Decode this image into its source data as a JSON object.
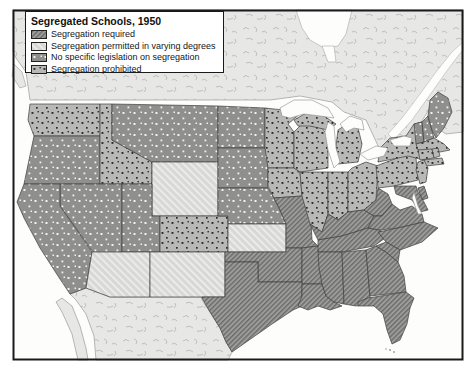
{
  "map": {
    "title": "Segregated Schools, 1950",
    "legend": [
      {
        "id": "required",
        "label": "Segregation required"
      },
      {
        "id": "permitted",
        "label": "Segregation permitted in varying degrees"
      },
      {
        "id": "no_legislation",
        "label": "No specific legislation on segregation"
      },
      {
        "id": "prohibited",
        "label": "Segregation prohibited"
      }
    ],
    "categories": {
      "required": [
        "TX",
        "OK",
        "MO",
        "AR",
        "LA",
        "MS",
        "AL",
        "TN",
        "KY",
        "WV",
        "VA",
        "NC",
        "SC",
        "GA",
        "FL",
        "MD",
        "DE"
      ],
      "permitted": [
        "AZ",
        "NM",
        "KS",
        "WY"
      ],
      "no_legislation": [
        "CA",
        "OR",
        "NV",
        "UT",
        "MT",
        "ND",
        "SD",
        "NE",
        "ME",
        "NH",
        "VT"
      ],
      "prohibited": [
        "WA",
        "ID",
        "CO",
        "MN",
        "IA",
        "WI",
        "IL",
        "IN",
        "MI",
        "OH",
        "PA",
        "NY",
        "NJ",
        "CT",
        "RI",
        "MA"
      ]
    },
    "colors": {
      "required": {
        "bg": "#9c9c9a",
        "mark": "#6c6c6a"
      },
      "permitted": {
        "bg": "#d8d8d6",
        "mark": "#f5f5f3"
      },
      "no_legislation": {
        "bg": "#8f8f8d",
        "mark": "#f2f2f0"
      },
      "prohibited": {
        "bg": "#b8b8b6",
        "mark": "#2a2a28"
      },
      "neighbor_land": "#e7e7e5",
      "terrain_mark": "#b2b2b0",
      "water": "#fdfdfc",
      "frame": "#1a1a1a"
    }
  }
}
